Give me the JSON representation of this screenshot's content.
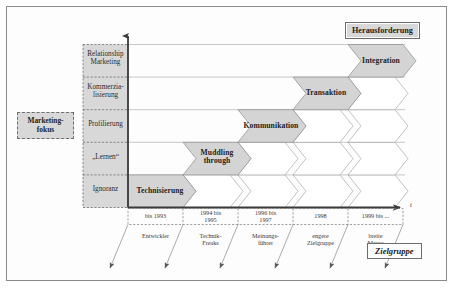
{
  "figure": {
    "type": "staircase-chevron-diagram",
    "axis_time_label": "t",
    "marketing_focus_box": "Marketing-\nfokus",
    "challenge_box": "Herausforderung",
    "target_group_box": "Zielgruppe"
  },
  "y_axis": {
    "name": "Marketing-fokus",
    "categories": [
      "Relationship\nMarketing",
      "Kommerzia-\nlisierung",
      "Profilierung",
      "„Lernen“",
      "Ignoranz"
    ]
  },
  "x_axis": {
    "name": "t",
    "categories": [
      "bis 1993",
      "1994 bis\n1995",
      "1996 bis\n1997",
      "1998",
      "1999 bis ..."
    ]
  },
  "target_groups": [
    "Entwickler",
    "Technik-\nFreaks",
    "Meinungs-\nführer",
    "engere\nZielgruppe",
    "breite\nMasse"
  ],
  "stages": [
    {
      "label": "Technisierung",
      "step": 0,
      "level": 0
    },
    {
      "label": "Muddling\nthrough",
      "step": 1,
      "level": 1
    },
    {
      "label": "Kommunikation",
      "step": 2,
      "level": 2
    },
    {
      "label": "Transaktion",
      "step": 3,
      "level": 3
    },
    {
      "label": "Integration",
      "step": 4,
      "level": 4
    }
  ],
  "colors": {
    "chevron_fill": "#d4d4d4",
    "chevron_empty_fill": "#ffffff",
    "chevron_stroke": "#8c8c8c",
    "band_fill": "#d8d8d8",
    "axis_stroke": "#3a3a3a",
    "grid_stroke": "#9a9a9a",
    "frame_stroke": "#8a8a8a",
    "text": "#2b2b2b"
  }
}
